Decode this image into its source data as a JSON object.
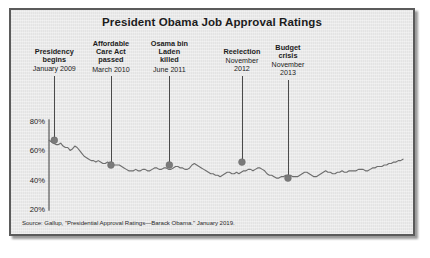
{
  "chart_data": {
    "type": "line",
    "title": "President Obama Job Approval Ratings",
    "xlabel": "",
    "ylabel": "",
    "ylim": [
      15,
      85
    ],
    "yticks": [
      "20%",
      "40%",
      "60%",
      "80%"
    ],
    "ytick_values": [
      20,
      40,
      60,
      80
    ],
    "grid": false,
    "legend": null,
    "source": "Source: Gallup, \"Presidential Approval Ratings—Barack Obama.\" January 2019.",
    "series": [
      {
        "name": "Job Approval",
        "values": [
          67,
          66,
          65,
          64,
          64,
          65,
          63,
          62,
          62,
          60,
          61,
          63,
          62,
          60,
          58,
          56,
          55,
          54,
          53,
          53,
          52,
          53,
          52,
          51,
          51,
          52,
          51,
          50,
          50,
          50,
          50,
          49,
          48,
          47,
          46,
          46,
          46,
          47,
          46,
          46,
          47,
          47,
          46,
          46,
          47,
          48,
          48,
          47,
          47,
          48,
          48,
          47,
          47,
          48,
          49,
          49,
          48,
          48,
          47,
          47,
          48,
          50,
          51,
          50,
          49,
          48,
          47,
          46,
          45,
          44,
          44,
          43,
          43,
          42,
          43,
          44,
          45,
          45,
          44,
          44,
          45,
          44,
          45,
          46,
          46,
          47,
          47,
          46,
          47,
          48,
          48,
          47,
          46,
          44,
          43,
          43,
          42,
          41,
          41,
          42,
          42,
          43,
          43,
          43,
          42,
          42,
          42,
          43,
          44,
          45,
          45,
          44,
          43,
          42,
          42,
          43,
          44,
          45,
          46,
          45,
          45,
          44,
          44,
          45,
          45,
          46,
          45,
          45,
          46,
          46,
          46,
          46,
          47,
          47,
          47,
          46,
          46,
          47,
          48,
          48,
          49,
          49,
          49,
          50,
          50,
          51,
          51,
          52,
          52,
          53,
          53,
          54
        ]
      }
    ],
    "events": [
      {
        "id": "presidency-begins",
        "label": "Presidency\nbegins",
        "date": "January 2009",
        "value": 67,
        "x_pct": 1.5
      },
      {
        "id": "aca-passed",
        "label": "Affordable\nCare Act\npassed",
        "date": "March 2010",
        "value": 50,
        "x_pct": 17.5
      },
      {
        "id": "osama-killed",
        "label": "Osama bin\nLaden\nkilled",
        "date": "June 2011",
        "value": 50,
        "x_pct": 34.0
      },
      {
        "id": "reelection",
        "label": "Reelection",
        "date": "November\n2012",
        "value": 52,
        "x_pct": 54.5
      },
      {
        "id": "budget-crisis",
        "label": "Budget\ncrisis",
        "date": "November\n2013",
        "value": 41,
        "x_pct": 67.5
      },
      {
        "id": "final-approval",
        "label": "Final\napproval",
        "date": "January 2017",
        "value": 54,
        "x_pct": 112.0
      }
    ],
    "colors": {
      "background": "#e8e8e8",
      "line": "#6e6e6e",
      "marker": "#7a7a7a",
      "axis": "#3d3d3d",
      "text": "#1c1c1c",
      "frame": "#5b5b5b"
    }
  }
}
